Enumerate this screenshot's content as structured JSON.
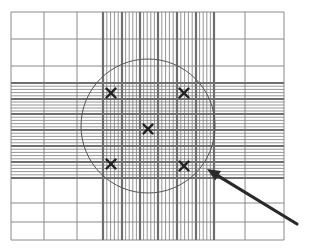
{
  "diagram": {
    "type": "hemocytometer-grid",
    "canvas": {
      "width": 309,
      "height": 251,
      "background": "#ffffff"
    },
    "frame": {
      "x0": 11,
      "y0": 12,
      "x1": 284,
      "y1": 240
    },
    "colors": {
      "light_line": "#8a8a8a",
      "thick_line": "#6e6e6e",
      "fine_line": "#7a7a7a",
      "circle": "#555555",
      "mark": "#222222",
      "arrow": "#2a2a2a"
    },
    "coarse_vertical": [
      11,
      44,
      77,
      103,
      214,
      245,
      284
    ],
    "coarse_horizontal": [
      12,
      39,
      66,
      83,
      178,
      203,
      222,
      240
    ],
    "central_columns": {
      "x_start": 103,
      "x_end": 214,
      "thick_lines": [
        103,
        122,
        140,
        158,
        177,
        196,
        214
      ],
      "fine_per_cell": 4
    },
    "central_rows": {
      "y_start": 83,
      "y_end": 178,
      "thick_lines": [
        83,
        99,
        114,
        130,
        146,
        162,
        178
      ],
      "fine_per_cell": 4
    },
    "circle": {
      "cx": 148,
      "cy": 126,
      "r": 67
    },
    "marks": [
      {
        "label": "top-left-square",
        "x": 111,
        "y": 93
      },
      {
        "label": "top-right-square",
        "x": 184,
        "y": 93
      },
      {
        "label": "center-square",
        "x": 148,
        "y": 129
      },
      {
        "label": "bottom-left-square",
        "x": 111,
        "y": 164
      },
      {
        "label": "bottom-right-square",
        "x": 184,
        "y": 166
      }
    ],
    "mark_glyph": "×",
    "arrow": {
      "tail_x": 297,
      "tail_y": 224,
      "tip_x": 207,
      "tip_y": 169
    }
  }
}
